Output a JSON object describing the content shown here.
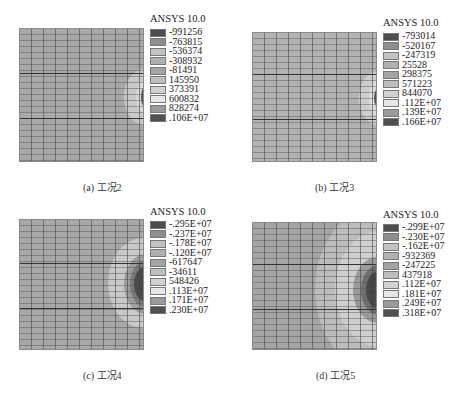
{
  "figure": {
    "software_label": "ANSYS 10.0",
    "panels": [
      {
        "id": "a",
        "caption": "(a) 工况2",
        "legend_values": [
          "-991256",
          "-763815",
          "-536374",
          "-308932",
          "-81491",
          "145950",
          "373391",
          "600832",
          "828274",
          ".106E+07"
        ]
      },
      {
        "id": "b",
        "caption": "(b) 工况3",
        "legend_values": [
          "-793014",
          "-520167",
          "-247319",
          "25528",
          "298375",
          "571223",
          "844070",
          ".112E+07",
          ".139E+07",
          ".166E+07"
        ]
      },
      {
        "id": "c",
        "caption": "(c) 工况4",
        "legend_values": [
          "-.295E+07",
          "-.237E+07",
          "-.178E+07",
          "-.120E+07",
          "-617647",
          "-34611",
          "548426",
          ".113E+07",
          ".171E+07",
          ".230E+07"
        ]
      },
      {
        "id": "d",
        "caption": "(d) 工况5",
        "legend_values": [
          "-.299E+07",
          "-.230E+07",
          "-.162E+07",
          "-932369",
          "-247225",
          "437918",
          ".112E+07",
          ".181E+07",
          ".249E+07",
          ".318E+07"
        ]
      }
    ],
    "legend_colors": [
      "#4d4d4d",
      "#8f8f8f",
      "#c2c2c2",
      "#b0b0b0",
      "#a3a3a3",
      "#bdbdbd",
      "#d2d2d2",
      "#e6e6e6",
      "#9a9a9a",
      "#505050"
    ]
  }
}
